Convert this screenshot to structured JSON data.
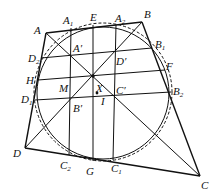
{
  "diagram": {
    "type": "geometry",
    "points": {
      "A": [
        46,
        33
      ],
      "B": [
        142,
        22
      ],
      "C": [
        200,
        176
      ],
      "D": [
        25,
        148
      ],
      "A1": [
        71,
        28
      ],
      "E": [
        93,
        25
      ],
      "A2": [
        116,
        25
      ],
      "B1": [
        152,
        48
      ],
      "F": [
        165,
        70
      ],
      "B2": [
        171,
        92
      ],
      "C2": [
        69,
        155
      ],
      "G": [
        93,
        161
      ],
      "C1": [
        113,
        160
      ],
      "D2": [
        41,
        58
      ],
      "H": [
        38,
        80
      ],
      "D1": [
        35,
        100
      ],
      "Ap": [
        71,
        55
      ],
      "Dp": [
        115,
        52
      ],
      "Bp": [
        71,
        100
      ],
      "Cp": [
        113,
        96
      ],
      "Xc": [
        93,
        76
      ],
      "X": [
        97,
        93
      ],
      "I": [
        95,
        98
      ],
      "M": [
        76,
        88
      ]
    },
    "circle_solid": {
      "cx": 103,
      "cy": 93,
      "r": 66
    },
    "circle_dashed": {
      "cx": 103,
      "cy": 92,
      "r": 69
    },
    "labels": [
      {
        "text": "A",
        "sub": "",
        "x": 34,
        "y": 34
      },
      {
        "text": "A",
        "sub": "1",
        "x": 63,
        "y": 24
      },
      {
        "text": "E",
        "sub": "",
        "x": 90,
        "y": 21
      },
      {
        "text": "A",
        "sub": "2",
        "x": 115,
        "y": 22
      },
      {
        "text": "B",
        "sub": "",
        "x": 144,
        "y": 18
      },
      {
        "text": "B",
        "sub": "1",
        "x": 155,
        "y": 48
      },
      {
        "text": "F",
        "sub": "",
        "x": 166,
        "y": 70
      },
      {
        "text": "B",
        "sub": "2",
        "x": 173,
        "y": 95
      },
      {
        "text": "C",
        "sub": "",
        "x": 201,
        "y": 189
      },
      {
        "text": "C",
        "sub": "1",
        "x": 111,
        "y": 172
      },
      {
        "text": "G",
        "sub": "",
        "x": 86,
        "y": 175
      },
      {
        "text": "C",
        "sub": "2",
        "x": 60,
        "y": 169
      },
      {
        "text": "D",
        "sub": "",
        "x": 13,
        "y": 157
      },
      {
        "text": "D",
        "sub": "1",
        "x": 21,
        "y": 103
      },
      {
        "text": "H",
        "sub": "",
        "x": 26,
        "y": 84
      },
      {
        "text": "D",
        "sub": "2",
        "x": 28,
        "y": 62
      },
      {
        "text": "A",
        "sub": "′",
        "x": 73,
        "y": 52
      },
      {
        "text": "D",
        "sub": "′",
        "x": 116,
        "y": 65
      },
      {
        "text": "B",
        "sub": "′",
        "x": 73,
        "y": 112
      },
      {
        "text": "C",
        "sub": "′",
        "x": 116,
        "y": 94
      },
      {
        "text": "M",
        "sub": "",
        "x": 59,
        "y": 92
      },
      {
        "text": "X",
        "sub": "",
        "x": 96,
        "y": 92
      },
      {
        "text": "I",
        "sub": "",
        "x": 101,
        "y": 105
      }
    ]
  }
}
